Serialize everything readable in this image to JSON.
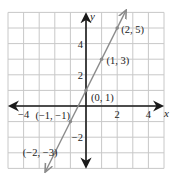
{
  "chart_data": {
    "type": "line",
    "title": "",
    "equation_implied": "y = 2x + 1",
    "xlabel": "x",
    "ylabel": "y",
    "xlim": [
      -5,
      5
    ],
    "ylim": [
      -4,
      6
    ],
    "grid": true,
    "x_tick_labels": [
      {
        "value": -4,
        "label": "−4"
      },
      {
        "value": 2,
        "label": "2"
      },
      {
        "value": 4,
        "label": "4"
      }
    ],
    "y_tick_labels": [
      {
        "value": 4,
        "label": "4"
      },
      {
        "value": 2,
        "label": "2"
      },
      {
        "value": -2,
        "label": "−2"
      }
    ],
    "series": [
      {
        "name": "line",
        "color": "#8a8a8a",
        "points": [
          {
            "x": -2,
            "y": -3,
            "label": "(−2, −3)"
          },
          {
            "x": -1,
            "y": -1,
            "label": "(−1, −1)"
          },
          {
            "x": 0,
            "y": 1,
            "label": "(0, 1)"
          },
          {
            "x": 1,
            "y": 3,
            "label": "(1, 3)"
          },
          {
            "x": 2,
            "y": 5,
            "label": "(2, 5)"
          }
        ],
        "arrows_both_ends": true
      }
    ]
  },
  "colors": {
    "grid": "#c8c8c8",
    "axis": "#1a1a1a",
    "line": "#8a8a8a",
    "text": "#222222"
  }
}
